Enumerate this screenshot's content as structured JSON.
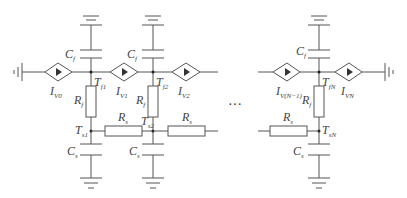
{
  "diagram": {
    "type": "circuit",
    "colors": {
      "wire": "#555555",
      "text": "#444444",
      "background": "#ffffff"
    },
    "ellipsis": "…",
    "sources": [
      {
        "id": "IV0",
        "main": "I",
        "sub": "V0"
      },
      {
        "id": "IV1",
        "main": "I",
        "sub": "V1"
      },
      {
        "id": "IV2",
        "main": "I",
        "sub": "V2"
      },
      {
        "id": "IVN1",
        "main": "I",
        "sub": "V(N−1)"
      },
      {
        "id": "IVN",
        "main": "I",
        "sub": "VN"
      }
    ],
    "nodes": {
      "Tf1": {
        "main": "T",
        "sub": "f1"
      },
      "Tf2": {
        "main": "T",
        "sub": "f2"
      },
      "TfN": {
        "main": "T",
        "sub": "fN"
      },
      "Ts1": {
        "main": "T",
        "sub": "s1"
      },
      "Ts2": {
        "main": "T",
        "sub": "s2"
      },
      "TsN": {
        "main": "T",
        "sub": "sN"
      }
    },
    "components": {
      "Cf": {
        "main": "C",
        "sub": "f"
      },
      "Rf": {
        "main": "R",
        "sub": "f"
      },
      "Rs": {
        "main": "R",
        "sub": "s"
      },
      "Cs": {
        "main": "C",
        "sub": "s"
      }
    }
  }
}
